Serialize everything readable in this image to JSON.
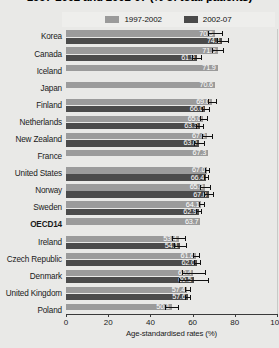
{
  "chart": {
    "title": "1997-2002 and 2002-07 (% of total patients)",
    "xlabel": "Age-standardised rates (%)",
    "legend": [
      {
        "label": "1997-2002",
        "color": "#9b9b9b",
        "key": "period1"
      },
      {
        "label": "2002-07",
        "color": "#4b4b4b",
        "key": "period2"
      }
    ]
  },
  "chart_data": {
    "type": "bar",
    "orientation": "horizontal",
    "title": "1997-2002 and 2002-07 (% of total patients)",
    "xlabel": "Age-standardised rates (%)",
    "ylabel": "",
    "xlim": [
      0,
      100
    ],
    "xticks": [
      0,
      20,
      40,
      60,
      80,
      100
    ],
    "grid": true,
    "legend_position": "top",
    "categories": [
      "Korea",
      "Canada",
      "Iceland",
      "Japan",
      "Finland",
      "Netherlands",
      "New Zealand",
      "France",
      "United States",
      "Norway",
      "Sweden",
      "OECD14",
      "Ireland",
      "Czech Republic",
      "Denmark",
      "United Kingdom",
      "Poland"
    ],
    "highlight_category": "OECD14",
    "series": [
      {
        "name": "1997-2002",
        "color": "#9b9b9b",
        "values": [
          70.5,
          71.9,
          71.9,
          70.6,
          69.0,
          65.0,
          67.0,
          67.3,
          67.0,
          65.9,
          64.1,
          63.7,
          53.4,
          61.6,
          60.4,
          57.4,
          50.1
        ],
        "errors": [
          3.4,
          2.6,
          null,
          null,
          1.9,
          1.6,
          2.4,
          null,
          1.0,
          2.2,
          1.3,
          null,
          3.0,
          1.4,
          5.6,
          1.2,
          3.2
        ]
      },
      {
        "name": "2002-07",
        "color": "#4b4b4b",
        "values": [
          74.1,
          61.9,
          null,
          null,
          66.0,
          63.3,
          63.0,
          null,
          66.4,
          67.6,
          62.9,
          null,
          54.1,
          62.0,
          60.5,
          57.6,
          null
        ],
        "errors": [
          2.6,
          2.0,
          null,
          null,
          1.7,
          1.5,
          2.2,
          null,
          1.0,
          2.0,
          1.2,
          null,
          2.8,
          1.3,
          7.0,
          1.1,
          null
        ]
      }
    ],
    "bars": [
      {
        "category": "Korea",
        "period1": 70.5,
        "period2": 74.1,
        "label1": "70.5",
        "label2": "74.1"
      },
      {
        "category": "Canada",
        "period1": 71.9,
        "period2": 61.9,
        "label1": "71.9",
        "label2": "61.9"
      },
      {
        "category": "Iceland",
        "period1": 71.9,
        "period2": null,
        "label1": "71.9",
        "label2": ""
      },
      {
        "category": "Japan",
        "period1": 70.6,
        "period2": null,
        "label1": "70.6",
        "label2": ""
      },
      {
        "category": "Finland",
        "period1": 69.0,
        "period2": 66.0,
        "label1": "69.0",
        "label2": "66.0"
      },
      {
        "category": "Netherlands",
        "period1": 65.0,
        "period2": 63.3,
        "label1": "65.0",
        "label2": "63.3"
      },
      {
        "category": "New Zealand",
        "period1": 67.0,
        "period2": 63.0,
        "label1": "67.0",
        "label2": "63.0"
      },
      {
        "category": "France",
        "period1": 67.3,
        "period2": null,
        "label1": "67.3",
        "label2": ""
      },
      {
        "category": "United States",
        "period1": 67.0,
        "period2": 66.4,
        "label1": "67.0",
        "label2": "66.4"
      },
      {
        "category": "Norway",
        "period1": 65.9,
        "period2": 67.6,
        "label1": "65.9",
        "label2": "67.6"
      },
      {
        "category": "Sweden",
        "period1": 64.1,
        "period2": 62.9,
        "label1": "64.1",
        "label2": "62.9"
      },
      {
        "category": "OECD14",
        "period1": 63.7,
        "period2": null,
        "label1": "63.7",
        "label2": ""
      },
      {
        "category": "Ireland",
        "period1": 53.4,
        "period2": 54.1,
        "label1": "53.4",
        "label2": "54.1"
      },
      {
        "category": "Czech Republic",
        "period1": 61.6,
        "period2": 62.0,
        "label1": "61.6",
        "label2": "62.0"
      },
      {
        "category": "Denmark",
        "period1": 60.4,
        "period2": 60.5,
        "label1": "60.4",
        "label2": "60.5"
      },
      {
        "category": "United Kingdom",
        "period1": 57.4,
        "period2": 57.6,
        "label1": "57.4",
        "label2": "57.6"
      },
      {
        "category": "Poland",
        "period1": 50.1,
        "period2": null,
        "label1": "50.1",
        "label2": ""
      }
    ]
  }
}
